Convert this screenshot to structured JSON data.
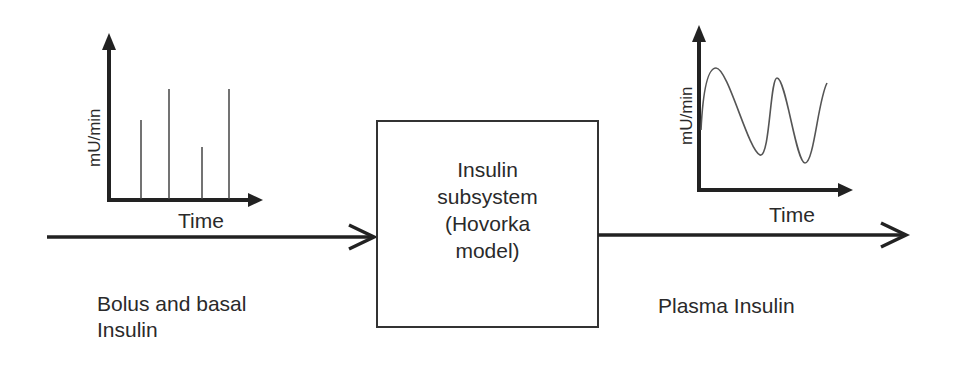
{
  "input": {
    "chart_ylabel": "mU/min",
    "chart_xlabel": "Time",
    "label_line1": "Bolus and basal",
    "label_line2": "Insulin"
  },
  "block": {
    "line1": "Insulin",
    "line2": "subsystem",
    "line3": "(Hovorka",
    "line4": "model)"
  },
  "output": {
    "chart_ylabel": "mU/min",
    "chart_xlabel": "Time",
    "label": "Plasma Insulin"
  },
  "colors": {
    "stroke": "#222222",
    "text": "#2a2a2a",
    "curve": "#555555"
  }
}
